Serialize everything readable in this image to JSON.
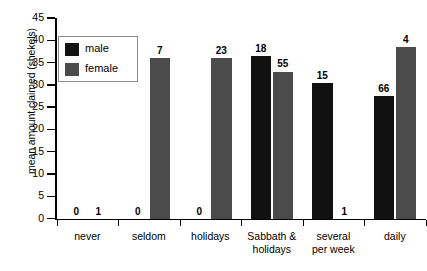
{
  "chart_data": {
    "type": "bar",
    "title": "",
    "xlabel": "",
    "ylabel": "mean amount claimed (shekels)",
    "ylim": [
      0,
      45
    ],
    "yticks": [
      0,
      5,
      10,
      15,
      20,
      25,
      30,
      35,
      40,
      45
    ],
    "grid": false,
    "legend_position": "top-left",
    "categories": [
      "never",
      "seldom",
      "holidays",
      "Sabbath &\nholidays",
      "several\nper week",
      "daily"
    ],
    "category_lines": [
      [
        "never"
      ],
      [
        "seldom"
      ],
      [
        "holidays"
      ],
      [
        "Sabbath &",
        "holidays"
      ],
      [
        "several",
        "per week"
      ],
      [
        "daily"
      ]
    ],
    "series": [
      {
        "name": "male",
        "color": "#111111",
        "values": [
          0,
          0,
          0,
          36.5,
          30.5,
          27.5
        ],
        "point_labels": [
          "0",
          "0",
          "0",
          "18",
          "15",
          "66"
        ]
      },
      {
        "name": "female",
        "color": "#4b4b4b",
        "values": [
          0,
          36.0,
          36.0,
          33.0,
          0,
          38.5
        ],
        "point_labels": [
          "1",
          "7",
          "23",
          "55",
          "1",
          "4"
        ]
      }
    ],
    "legend": [
      {
        "label": "male",
        "color": "#111111"
      },
      {
        "label": "female",
        "color": "#4b4b4b"
      }
    ],
    "ytick_labels": [
      "0",
      "5",
      "10",
      "15",
      "20",
      "25",
      "30",
      "35",
      "40",
      "45"
    ],
    "colors": {
      "male": "#111111",
      "female": "#4b4b4b",
      "axis": "#000000",
      "legend_border": "#8c8c8c",
      "background": "#ffffff"
    }
  }
}
